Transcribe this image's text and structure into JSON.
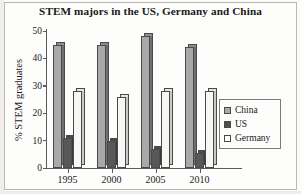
{
  "chart_data": {
    "type": "bar",
    "title": "STEM majors in the US, Germany and China",
    "xlabel": "",
    "ylabel": "% STEM graduates",
    "categories": [
      "1995",
      "2000",
      "2005",
      "2010"
    ],
    "series": [
      {
        "name": "China",
        "color": "#a9a9a9",
        "values": [
          45,
          45,
          48,
          44
        ]
      },
      {
        "name": "US",
        "color": "#4f4f4f",
        "values": [
          11,
          10,
          7,
          5.5
        ]
      },
      {
        "name": "Germany",
        "color": "#ffffff",
        "values": [
          28,
          26,
          28,
          28
        ]
      }
    ],
    "ylim": [
      0,
      50
    ],
    "yticks": [
      0,
      10,
      20,
      30,
      40,
      50
    ],
    "grid": false,
    "legend_position": "right"
  },
  "axis": {
    "y_label": "% STEM graduates",
    "y_ticks": [
      "50",
      "40",
      "30",
      "20",
      "10",
      "0"
    ],
    "x_ticks": [
      "1995",
      "2000",
      "2005",
      "2010"
    ]
  },
  "legend": {
    "items": [
      {
        "label": "China"
      },
      {
        "label": "US"
      },
      {
        "label": "Germany"
      }
    ]
  }
}
